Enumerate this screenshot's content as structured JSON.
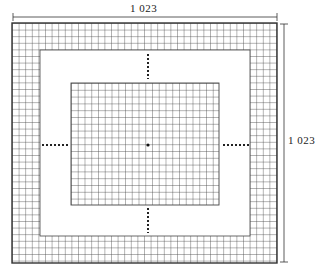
{
  "diagram": {
    "top_dimension_label": "1  023",
    "right_dimension_label": "1  023",
    "colors": {
      "line": "#333333",
      "grid": "#555555",
      "background": "#ffffff"
    },
    "outer_frame": {
      "x": 12,
      "y": 23,
      "w": 265,
      "h": 240,
      "band": 27
    },
    "inner_grid": {
      "x": 71,
      "y": 83,
      "w": 148,
      "h": 122
    },
    "cell_size": 6.6,
    "center_marker": {
      "x": 148,
      "y": 145
    }
  }
}
